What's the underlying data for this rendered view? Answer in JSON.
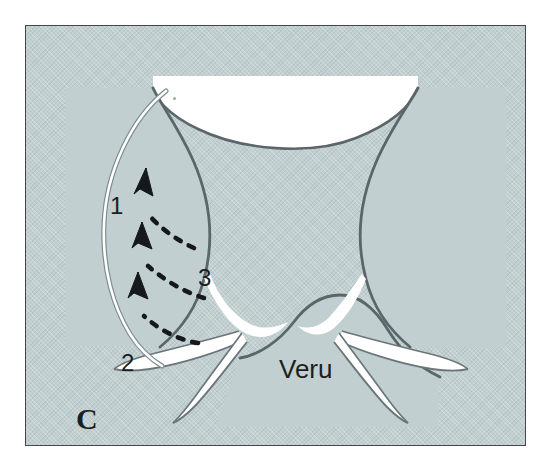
{
  "figure": {
    "panel_letter": "C",
    "kind": "medical-line-illustration",
    "background_color": "#c2cfd0",
    "border_color": "#40494c",
    "ink_color": "#4a5458",
    "lumen_color": "#ffffff",
    "label_color": "#1b1f21"
  },
  "labels": {
    "one": "1",
    "two": "2",
    "three": "3",
    "veru": "Veru",
    "panel": "C"
  },
  "annotations": {
    "arrows": [
      {
        "id": "arrow-top",
        "number_ref": "3",
        "direction": "up-left",
        "style": "dashed-curved"
      },
      {
        "id": "arrow-middle",
        "number_ref": "3",
        "direction": "up-left",
        "style": "dashed-curved"
      },
      {
        "id": "arrow-bottom",
        "number_ref": "3",
        "direction": "up-left",
        "style": "dashed-curved"
      }
    ],
    "instrument": {
      "id": "guide-wire",
      "description": "thin white curved instrument spanning label 1 to label 2",
      "endpoint_top_ref": "1",
      "endpoint_bottom_ref": "2"
    }
  },
  "structures": [
    {
      "id": "upper-lumen",
      "name": "upper urethral lumen"
    },
    {
      "id": "left-lobe",
      "name": "left prostatic lobe"
    },
    {
      "id": "right-lobe",
      "name": "right prostatic lobe"
    },
    {
      "id": "veru-mound",
      "name": "veru montanum"
    },
    {
      "id": "left-branch-outer",
      "name": "left lateral channel"
    },
    {
      "id": "left-branch-inner",
      "name": "left inferior channel"
    },
    {
      "id": "right-branch-outer",
      "name": "right lateral channel"
    },
    {
      "id": "right-branch-inner",
      "name": "right inferior channel"
    }
  ]
}
